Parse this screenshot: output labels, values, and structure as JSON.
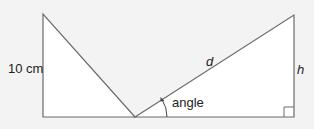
{
  "diagram": {
    "type": "geometry-two-right-triangles",
    "colors": {
      "background": "#f3f3f3",
      "fill": "#ffffff",
      "stroke": "#6b6b6b",
      "text": "#222222"
    },
    "left_triangle": {
      "vertical_side_label": "10 cm"
    },
    "right_triangle": {
      "hypotenuse_label": "d",
      "vertical_side_label": "h",
      "angle_label": "angle",
      "right_angle_marker": true
    }
  }
}
